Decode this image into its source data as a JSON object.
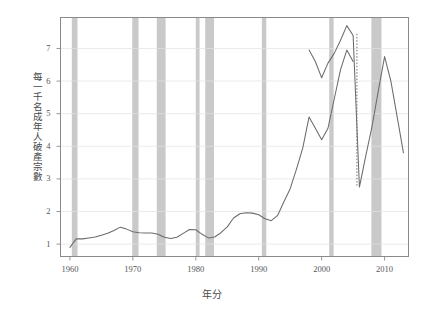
{
  "figure": {
    "title": "",
    "y_axis_title": "每一千名成年人破產宗數",
    "x_axis_title": "年分"
  },
  "chart_data": {
    "type": "line",
    "title": "",
    "subtitle": "",
    "xlabel": "年分",
    "ylabel": "每一千名成年人破產宗數",
    "xlim": [
      1958.5,
      2013.8
    ],
    "ylim": [
      0.62,
      7.95
    ],
    "xticks": [
      1960,
      1970,
      1980,
      1990,
      2000,
      2010
    ],
    "xtick_labels": [
      "1960",
      "1970",
      "1980",
      "1990",
      "2000",
      "2010"
    ],
    "yticks": [
      1,
      2,
      3,
      4,
      5,
      6,
      7
    ],
    "ytick_labels": [
      "1",
      "2",
      "3",
      "4",
      "5",
      "6",
      "7"
    ],
    "grid": "horizontal",
    "legend": "none",
    "line_color": "#6b6b6b",
    "band_color": "#c4c4c4",
    "frame_color": "#8a8a8a",
    "gridline_color": "#e2e2e2",
    "series": [
      {
        "name": "破產宗數",
        "style": "solid",
        "x": [
          1960,
          1961,
          1962,
          1963,
          1964,
          1965,
          1966,
          1967,
          1968,
          1969,
          1970,
          1971,
          1972,
          1973,
          1974,
          1975,
          1976,
          1977,
          1978,
          1979,
          1980,
          1981,
          1982,
          1983,
          1984,
          1985,
          1986,
          1987,
          1988,
          1989,
          1990,
          1991,
          1992,
          1993,
          1994,
          1995,
          1996,
          1997,
          1998,
          1999,
          2000,
          2001,
          2002,
          2003,
          2004,
          2005
        ],
        "values": [
          0.9,
          1.16,
          1.16,
          1.19,
          1.22,
          1.27,
          1.33,
          1.42,
          1.52,
          1.46,
          1.38,
          1.35,
          1.34,
          1.34,
          1.3,
          1.21,
          1.17,
          1.21,
          1.33,
          1.45,
          1.44,
          1.3,
          1.19,
          1.22,
          1.35,
          1.53,
          1.8,
          1.93,
          1.96,
          1.95,
          1.9,
          1.78,
          1.72,
          1.88,
          2.3,
          2.7,
          3.3,
          3.95,
          4.9,
          4.55,
          4.2,
          4.55,
          5.45,
          6.35,
          6.95,
          6.6
        ]
      },
      {
        "name": "破產宗數（續）",
        "style": "solid",
        "x": [
          1998,
          1999,
          2000,
          2001,
          2002,
          2003,
          2004,
          2005,
          2006,
          2007,
          2008,
          2009,
          2010,
          2011,
          2012,
          2013
        ],
        "values": [
          6.95,
          6.6,
          6.1,
          6.55,
          6.85,
          7.25,
          7.7,
          7.4,
          2.75,
          3.7,
          4.6,
          5.7,
          6.75,
          6.0,
          4.9,
          3.8
        ]
      }
    ],
    "drop_line": {
      "name": "2005-破產法改革斷點",
      "style": "dotted",
      "x": 2005.6,
      "y_from": 7.45,
      "y_to": 2.75
    },
    "recession_bands": [
      {
        "start": 1960.3,
        "end": 1961.2
      },
      {
        "start": 1969.9,
        "end": 1970.9
      },
      {
        "start": 1973.8,
        "end": 1975.2
      },
      {
        "start": 1980.0,
        "end": 1980.6
      },
      {
        "start": 1981.5,
        "end": 1982.9
      },
      {
        "start": 1990.5,
        "end": 1991.2
      },
      {
        "start": 2001.2,
        "end": 2001.9
      },
      {
        "start": 2007.9,
        "end": 2009.5
      }
    ]
  }
}
